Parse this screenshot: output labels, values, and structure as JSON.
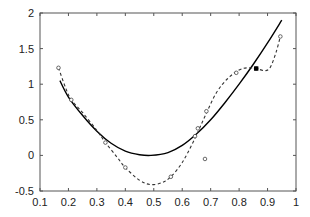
{
  "chart_data": {
    "type": "line",
    "title": "",
    "xlabel": "",
    "ylabel": "",
    "xlim": [
      0.1,
      1.0
    ],
    "ylim": [
      -0.5,
      2.0
    ],
    "grid": false,
    "legend": null,
    "x_ticks": [
      0.1,
      0.2,
      0.3,
      0.4,
      0.5,
      0.6,
      0.7,
      0.8,
      0.9,
      1.0
    ],
    "x_tick_labels": [
      "0.1",
      "0.2",
      "0.3",
      "0.4",
      "0.5",
      "0.6",
      "0.7",
      "0.8",
      "0.9",
      "1"
    ],
    "y_ticks": [
      -0.5,
      0,
      0.5,
      1,
      1.5,
      2
    ],
    "y_tick_labels": [
      "-0.5",
      "0",
      "0.5",
      "1",
      "1.5",
      "2"
    ],
    "series": [
      {
        "name": "smooth fit",
        "style": "solid",
        "color": "#000000",
        "x": [
          0.17,
          0.2,
          0.25,
          0.3,
          0.35,
          0.4,
          0.45,
          0.49,
          0.55,
          0.6,
          0.65,
          0.7,
          0.75,
          0.8,
          0.85,
          0.9,
          0.95
        ],
        "y": [
          1.05,
          0.82,
          0.56,
          0.34,
          0.17,
          0.06,
          0.01,
          0.0,
          0.04,
          0.14,
          0.3,
          0.5,
          0.74,
          1.0,
          1.28,
          1.58,
          1.9
        ]
      },
      {
        "name": "interpolant",
        "style": "dashed",
        "color": "#333333",
        "x": [
          0.165,
          0.19,
          0.21,
          0.25,
          0.3,
          0.33,
          0.37,
          0.4,
          0.45,
          0.49,
          0.53,
          0.56,
          0.6,
          0.64,
          0.68,
          0.72,
          0.76,
          0.8,
          0.83,
          0.86,
          0.89,
          0.91,
          0.93,
          0.945
        ],
        "y": [
          1.23,
          0.95,
          0.78,
          0.6,
          0.35,
          0.18,
          -0.02,
          -0.17,
          -0.35,
          -0.41,
          -0.38,
          -0.3,
          -0.1,
          0.2,
          0.55,
          0.88,
          1.08,
          1.2,
          1.23,
          1.22,
          1.19,
          1.24,
          1.45,
          1.67
        ]
      }
    ],
    "points": {
      "name": "samples",
      "marker": "circle-open",
      "x": [
        0.165,
        0.21,
        0.33,
        0.4,
        0.56,
        0.645,
        0.655,
        0.68,
        0.685,
        0.79,
        0.86,
        0.945
      ],
      "y": [
        1.23,
        0.78,
        0.18,
        -0.17,
        -0.3,
        0.27,
        0.38,
        -0.05,
        0.62,
        1.16,
        1.22,
        1.67
      ]
    },
    "highlight": {
      "marker": "square-filled",
      "x": 0.86,
      "y": 1.22
    }
  }
}
